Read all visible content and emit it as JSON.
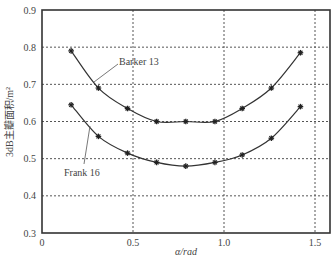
{
  "chart_data": {
    "type": "line",
    "title": "",
    "xlabel": "α/rad",
    "ylabel": "3dB主瓣面积/m²",
    "xlim": [
      0,
      1.57
    ],
    "ylim": [
      0.3,
      0.9
    ],
    "xticks": [
      0,
      0.5,
      1.0,
      1.5
    ],
    "xtick_labels": [
      "0",
      "0.5",
      "1.0",
      "1.5"
    ],
    "yticks": [
      0.3,
      0.4,
      0.5,
      0.6,
      0.7,
      0.8,
      0.9
    ],
    "ytick_labels": [
      "0.3",
      "0.4",
      "0.5",
      "0.6",
      "0.7",
      "0.8",
      "0.9"
    ],
    "grid": true,
    "legend": "annotations",
    "x": [
      0.16,
      0.31,
      0.47,
      0.63,
      0.79,
      0.95,
      1.1,
      1.26,
      1.42
    ],
    "series": [
      {
        "name": "Barker 13",
        "values": [
          0.79,
          0.69,
          0.635,
          0.6,
          0.6,
          0.6,
          0.635,
          0.69,
          0.785
        ]
      },
      {
        "name": "Frank 16",
        "values": [
          0.645,
          0.56,
          0.515,
          0.49,
          0.48,
          0.49,
          0.51,
          0.555,
          0.64
        ]
      }
    ],
    "annotations": [
      {
        "text": "Barker 13",
        "target_series": "Barker 13"
      },
      {
        "text": "Frank 16",
        "target_series": "Frank 16"
      }
    ]
  }
}
